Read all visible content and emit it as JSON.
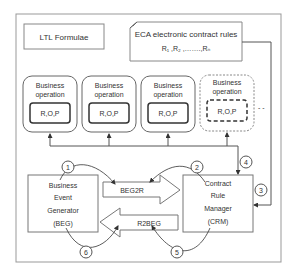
{
  "diagram": {
    "ltl_box": {
      "label": "LTL Formulae"
    },
    "eca_box": {
      "title": "ECA electronic contract rules",
      "rules": "R₁ ,R₂ ,…….,Rₙ"
    },
    "business_operations": [
      {
        "title_line1": "Business",
        "title_line2": "operation",
        "inner": "R,O,P",
        "style": "solid"
      },
      {
        "title_line1": "Business",
        "title_line2": "operation",
        "inner": "R,O,P",
        "style": "solid"
      },
      {
        "title_line1": "Business",
        "title_line2": "operation",
        "inner": "R,O,P",
        "style": "solid"
      },
      {
        "title_line1": "Business",
        "title_line2": "operation",
        "inner": "R,O,P",
        "style": "dashed"
      }
    ],
    "ellipsis": "- -",
    "beg": {
      "line1": "Business",
      "line2": "Event",
      "line3": "Generator",
      "line4": "(BEG)"
    },
    "crm": {
      "line1": "Contract",
      "line2": "Rule",
      "line3": "Manager",
      "line4": "(CRM)"
    },
    "arrows": {
      "beg2r": "BEG2R",
      "r2beg": "R2BEG"
    },
    "steps": [
      "1",
      "2",
      "3",
      "4",
      "5",
      "6"
    ],
    "colors": {
      "stroke": "#555555",
      "light_stroke": "#888888",
      "text": "#333333",
      "background": "#ffffff"
    }
  }
}
